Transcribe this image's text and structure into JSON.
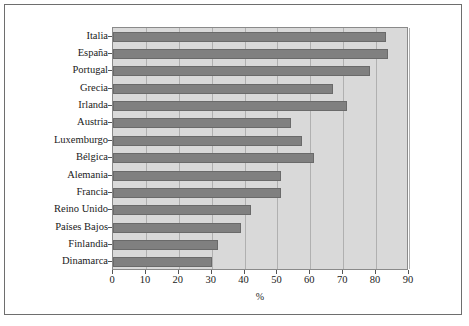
{
  "chart_data": {
    "type": "bar",
    "orientation": "horizontal",
    "title": "",
    "xlabel": "%",
    "ylabel": "",
    "xlim": [
      0,
      90
    ],
    "xticks": [
      0,
      10,
      20,
      30,
      40,
      50,
      60,
      70,
      80,
      90
    ],
    "grid": true,
    "grid_axis": "x",
    "legend": "none",
    "categories": [
      "Italia",
      "España",
      "Portugal",
      "Grecia",
      "Irlanda",
      "Austria",
      "Luxemburgo",
      "Bélgica",
      "Alemania",
      "Francia",
      "Reino Unido",
      "Países Bajos",
      "Finlandia",
      "Dinamarca"
    ],
    "values": [
      83,
      83.5,
      78,
      67,
      71,
      54,
      57.5,
      61,
      51,
      51,
      42,
      39,
      32,
      30
    ],
    "series": [
      {
        "name": "%",
        "values": [
          83,
          83.5,
          78,
          67,
          71,
          54,
          57.5,
          61,
          51,
          51,
          42,
          39,
          32,
          30
        ]
      }
    ]
  },
  "colors": {
    "bar_fill": "#808080",
    "bar_edge": "#6a6a6a",
    "plot_background": "#d9d9d9",
    "grid_line": "#b0b0b0",
    "axis_line": "#8a8a8a",
    "frame_border": "#6e6e6e",
    "text": "#1a1a1a",
    "page_background": "#ffffff"
  }
}
